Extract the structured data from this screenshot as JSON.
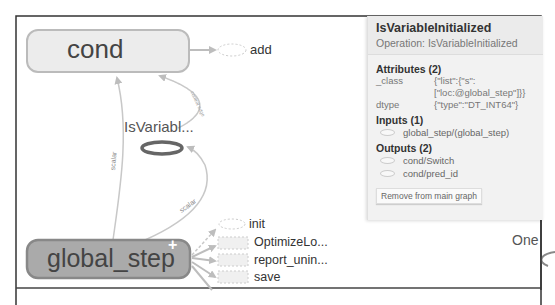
{
  "graph": {
    "nodes": {
      "cond": {
        "label": "cond"
      },
      "add": {
        "label": "add"
      },
      "is_variable": {
        "label": "IsVariabl..."
      },
      "global_step": {
        "label": "global_step",
        "expand_glyph": "+"
      },
      "init": {
        "label": "init"
      },
      "optimize": {
        "label": "OptimizeLo..."
      },
      "report": {
        "label": "report_unin..."
      },
      "save": {
        "label": "save"
      },
      "one": {
        "label": "One"
      }
    },
    "edges": {
      "scalar_label": "scalar",
      "control_label": "control edge"
    }
  },
  "info_panel": {
    "title": "IsVariableInitialized",
    "operation": "Operation: IsVariableInitialized",
    "attributes_title": "Attributes (2)",
    "attributes": [
      {
        "key": "_class",
        "value": "{\"list\":{\"s\": [\"loc:@global_step\"]}}"
      },
      {
        "key": "dtype",
        "value": "{\"type\":\"DT_INT64\"}"
      }
    ],
    "inputs_title": "Inputs (1)",
    "inputs": [
      {
        "label": "global_step/(global_step)"
      }
    ],
    "outputs_title": "Outputs (2)",
    "outputs": [
      {
        "label": "cond/Switch"
      },
      {
        "label": "cond/pred_id"
      }
    ],
    "remove_button": "Remove from main graph"
  }
}
